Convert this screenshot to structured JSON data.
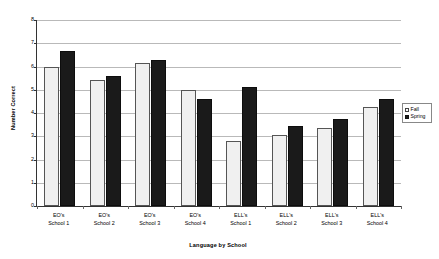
{
  "chart_data": {
    "type": "bar",
    "title": "",
    "xlabel": "Language by School",
    "ylabel": "Number Correct",
    "ylim": [
      0,
      8
    ],
    "yticks": [
      0,
      1,
      2,
      3,
      4,
      5,
      6,
      7,
      8
    ],
    "grid": true,
    "legend_position": "right",
    "categories": [
      "EO's School 1",
      "EO's School 2",
      "EO's School 3",
      "EO's School 4",
      "ELL's School 1",
      "ELL's School 2",
      "ELL's School 3",
      "ELL's School 4"
    ],
    "category_lines": [
      {
        "line1": "EO's",
        "line2": "School 1"
      },
      {
        "line1": "EO's",
        "line2": "School 2"
      },
      {
        "line1": "EO's",
        "line2": "School 3"
      },
      {
        "line1": "EO's",
        "line2": "School 4"
      },
      {
        "line1": "ELL's",
        "line2": "School 1"
      },
      {
        "line1": "ELL's",
        "line2": "School 2"
      },
      {
        "line1": "ELL's",
        "line2": "School 3"
      },
      {
        "line1": "ELL's",
        "line2": "School 4"
      }
    ],
    "series": [
      {
        "name": "Fall",
        "color": "#f0f0f0",
        "values": [
          6.0,
          5.4,
          6.15,
          5.0,
          2.8,
          3.05,
          3.35,
          4.25
        ]
      },
      {
        "name": "Spring",
        "color": "#1a1a1a",
        "values": [
          6.65,
          5.6,
          6.3,
          4.6,
          5.1,
          3.45,
          3.75,
          4.6
        ]
      }
    ]
  },
  "legend": {
    "items": [
      {
        "label": "Fall"
      },
      {
        "label": "Spring"
      }
    ]
  },
  "axes": {
    "y_title": "Number Correct",
    "x_title": "Language by School",
    "y_tick_labels": [
      "0",
      "1",
      "2",
      "3",
      "4",
      "5",
      "6",
      "7",
      "8"
    ]
  }
}
